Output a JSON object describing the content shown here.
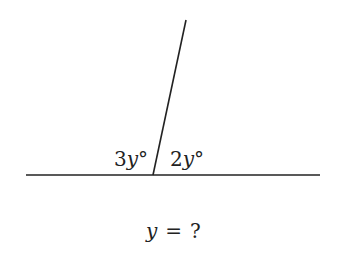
{
  "diagram": {
    "angle_left": {
      "coef": "3",
      "var": "y",
      "unit": "°"
    },
    "angle_right": {
      "coef": "2",
      "var": "y",
      "unit": "°"
    },
    "question": {
      "var": "y",
      "op": "=",
      "rhs": "?"
    },
    "line_color": "#222222"
  }
}
